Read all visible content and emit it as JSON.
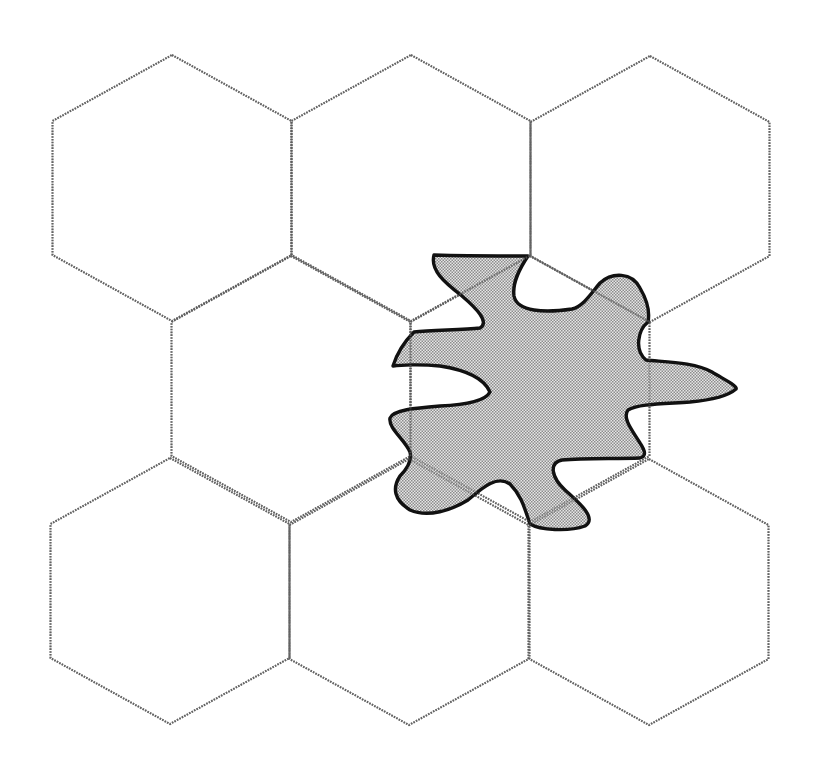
{
  "diagram": {
    "type": "hexagonal-cell-grid-with-coverage-blob",
    "colors": {
      "background": "#ffffff",
      "cell_outline": "#6e6e6e",
      "blob_outline": "#111111",
      "blob_fill_dark": "#8c8c8c",
      "blob_fill_light": "#e6e6e6"
    },
    "hex_geometry": {
      "half_width": 119.5,
      "top_offset": 133,
      "side_offset": 67
    },
    "cells": [
      {
        "id": "cell-r0-c0",
        "cx": 172,
        "cy": 188
      },
      {
        "id": "cell-r0-c1",
        "cx": 411,
        "cy": 188
      },
      {
        "id": "cell-r0-c2",
        "cx": 650,
        "cy": 189
      },
      {
        "id": "cell-r1-c0",
        "cx": 291,
        "cy": 389
      },
      {
        "id": "cell-r1-c1",
        "cx": 530,
        "cy": 389
      },
      {
        "id": "cell-r2-c0",
        "cx": 170,
        "cy": 591
      },
      {
        "id": "cell-r2-c1",
        "cx": 409,
        "cy": 592
      },
      {
        "id": "cell-r2-c2",
        "cx": 649,
        "cy": 592
      }
    ],
    "blob": {
      "label": "irregular coverage region",
      "path": "M434,255 C470,256 505,256 528,256 C520,268 512,282 514,296 C517,312 545,313 572,309 C584,306 592,292 600,283 C612,272 632,272 640,288 C647,300 650,312 648,322 C638,330 634,350 646,360 C665,362 695,362 712,372 C725,380 738,386 736,389 C728,396 712,400 690,402 C660,404 638,404 628,410 C622,418 632,430 640,443 C646,452 646,456 640,458 C615,459 585,458 562,460 C548,463 552,478 565,490 C578,502 598,518 585,526 C568,532 540,530 530,524 C525,510 522,496 510,484 C496,474 480,490 468,500 C452,510 428,518 410,510 C394,500 392,488 400,476 C408,468 412,460 410,452 C405,440 388,428 390,418 C393,410 415,408 440,406 C462,405 485,402 490,392 C484,378 466,370 440,366 C420,364 400,365 393,366 C398,350 406,340 414,332 C432,330 462,330 480,328 C490,322 476,308 462,296 C444,282 430,270 434,255 Z"
    }
  }
}
